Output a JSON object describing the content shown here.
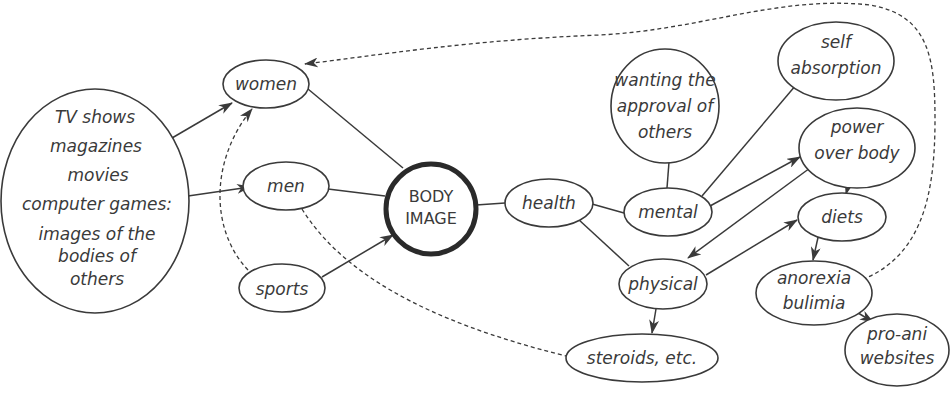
{
  "diagram": {
    "nodes": [
      {
        "id": "media",
        "lines": [
          "TV shows",
          "magazines",
          "movies",
          "computer games:",
          "images of the",
          "bodies of",
          "others"
        ]
      },
      {
        "id": "women",
        "lines": [
          "women"
        ]
      },
      {
        "id": "men",
        "lines": [
          "men"
        ]
      },
      {
        "id": "sports",
        "lines": [
          "sports"
        ]
      },
      {
        "id": "body_image",
        "lines": [
          "BODY",
          "IMAGE"
        ]
      },
      {
        "id": "health",
        "lines": [
          "health"
        ]
      },
      {
        "id": "wanting_approval",
        "lines": [
          "wanting the",
          "approval of",
          "others"
        ]
      },
      {
        "id": "mental",
        "lines": [
          "mental"
        ]
      },
      {
        "id": "self_absorption",
        "lines": [
          "self",
          "absorption"
        ]
      },
      {
        "id": "power_over_body",
        "lines": [
          "power",
          "over body"
        ]
      },
      {
        "id": "diets",
        "lines": [
          "diets"
        ]
      },
      {
        "id": "physical",
        "lines": [
          "physical"
        ]
      },
      {
        "id": "anorexia_bulimia",
        "lines": [
          "anorexia",
          "bulimia"
        ]
      },
      {
        "id": "steroids",
        "lines": [
          "steroids, etc."
        ]
      },
      {
        "id": "pro_ani",
        "lines": [
          "pro-ani",
          "websites"
        ]
      }
    ],
    "edges": [
      {
        "from": "media",
        "to": "women",
        "style": "solid",
        "arrow": true
      },
      {
        "from": "media",
        "to": "men",
        "style": "solid",
        "arrow": true
      },
      {
        "from": "women",
        "to": "body_image",
        "style": "solid",
        "arrow": false
      },
      {
        "from": "men",
        "to": "body_image",
        "style": "solid",
        "arrow": false
      },
      {
        "from": "sports",
        "to": "body_image",
        "style": "solid",
        "arrow": true
      },
      {
        "from": "sports",
        "to": "women",
        "style": "dashed",
        "arrow": true
      },
      {
        "from": "men",
        "to": "steroids",
        "style": "dashed",
        "arrow": false
      },
      {
        "from": "body_image",
        "to": "health",
        "style": "solid",
        "arrow": false
      },
      {
        "from": "health",
        "to": "mental",
        "style": "solid",
        "arrow": false
      },
      {
        "from": "health",
        "to": "physical",
        "style": "solid",
        "arrow": false
      },
      {
        "from": "wanting_approval",
        "to": "mental",
        "style": "solid",
        "arrow": false
      },
      {
        "from": "mental",
        "to": "self_absorption",
        "style": "solid",
        "arrow": false
      },
      {
        "from": "mental",
        "to": "power_over_body",
        "style": "solid",
        "arrow": true
      },
      {
        "from": "power_over_body",
        "to": "physical",
        "style": "solid",
        "arrow": true
      },
      {
        "from": "power_over_body",
        "to": "diets",
        "style": "solid",
        "arrow": true
      },
      {
        "from": "physical",
        "to": "diets",
        "style": "solid",
        "arrow": true
      },
      {
        "from": "physical",
        "to": "steroids",
        "style": "solid",
        "arrow": true
      },
      {
        "from": "diets",
        "to": "anorexia_bulimia",
        "style": "solid",
        "arrow": true
      },
      {
        "from": "anorexia_bulimia",
        "to": "pro_ani",
        "style": "solid",
        "arrow": true
      },
      {
        "from": "anorexia_bulimia",
        "to": "women",
        "style": "dashed",
        "arrow": true
      }
    ]
  }
}
